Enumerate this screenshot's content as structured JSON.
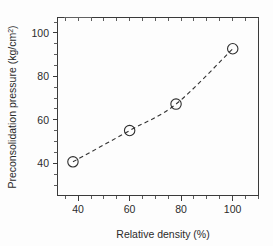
{
  "chart_data": {
    "type": "scatter",
    "title": "",
    "subtitle": "",
    "xlabel": "Relative density (%)",
    "ylabel": "Preconsolidation pressure (kg/cm²)",
    "ylabel_main": "Preconsolidation pressure (kg/cm",
    "ylabel_sup": "2",
    "ylabel_tail": ")",
    "xlim": [
      32,
      110
    ],
    "ylim": [
      31,
      105
    ],
    "xticks": [
      40,
      60,
      80,
      100
    ],
    "yticks": [
      40,
      60,
      80,
      100
    ],
    "xtick_labels": [
      "40",
      "60",
      "80",
      "100"
    ],
    "ytick_labels": [
      "40",
      "60",
      "80",
      "100"
    ],
    "x_minor_step": 5,
    "y_minor_step": 5,
    "grid": false,
    "legend": false,
    "legend_position": "none",
    "tick_direction": "out",
    "frame": "full-box",
    "marker_style": "open-circle",
    "line_style": "dashed",
    "series": [
      {
        "name": "Preconsolidation pressure vs relative density",
        "x": [
          38,
          60,
          78,
          100
        ],
        "values": [
          45,
          58,
          69,
          92
        ],
        "points": [
          {
            "x": 38,
            "y": 45
          },
          {
            "x": 60,
            "y": 58
          },
          {
            "x": 78,
            "y": 69
          },
          {
            "x": 100,
            "y": 92
          }
        ]
      }
    ],
    "colors": {
      "axis": "#3a3a3a",
      "text": "#2b2b2b",
      "line": "#333333",
      "marker_stroke": "#2e2e2e",
      "background": "#fdfdfd"
    }
  }
}
